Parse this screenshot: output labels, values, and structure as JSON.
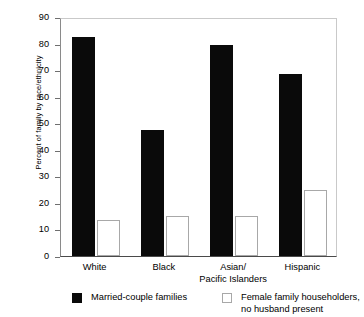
{
  "chart_data": {
    "type": "bar",
    "title": "",
    "xlabel": "",
    "ylabel": "Percent of family by race/ethnicity",
    "ylim": [
      0,
      90
    ],
    "ytick_values": [
      0,
      10,
      20,
      30,
      40,
      50,
      60,
      70,
      80,
      90
    ],
    "ytick_labels": [
      "0",
      "10",
      "20",
      "30",
      "40",
      "50",
      "60",
      "70",
      "80",
      "90"
    ],
    "grid": false,
    "legend_position": "bottom",
    "categories": [
      "White",
      "Black",
      "Asian/ Pacific Islanders",
      "Hispanic"
    ],
    "category_lines": [
      [
        "White"
      ],
      [
        "Black"
      ],
      [
        "Asian/",
        "Pacific Islanders"
      ],
      [
        "Hispanic"
      ]
    ],
    "series": [
      {
        "name": "Married-couple families",
        "color": "#0a0a0a",
        "style": "filled",
        "values": [
          82.5,
          47.5,
          79.5,
          68.5
        ]
      },
      {
        "name": "Female family householders, no husband present",
        "color": "#ffffff",
        "style": "hollow",
        "values": [
          13.5,
          15.0,
          15.0,
          25.0
        ]
      }
    ],
    "legend_entries": [
      {
        "swatch": "filled",
        "lines": [
          "Married-couple families"
        ]
      },
      {
        "swatch": "hollow",
        "lines": [
          "Female family householders,",
          "no husband present"
        ]
      }
    ]
  }
}
